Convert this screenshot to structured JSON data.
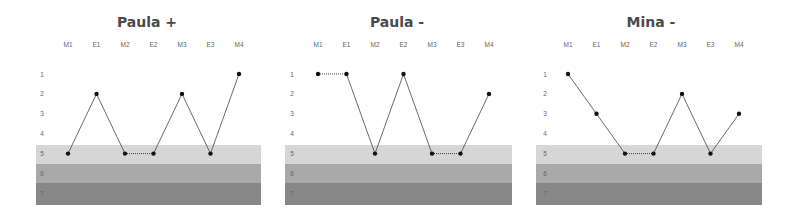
{
  "chart_data": [
    {
      "type": "line",
      "title": "Paula +",
      "categories": [
        "M1",
        "E1",
        "M2",
        "E2",
        "M3",
        "E3",
        "M4"
      ],
      "values": [
        5,
        2,
        5,
        5,
        2,
        5,
        1
      ],
      "ylabel": "",
      "xlabel": "",
      "y_ticks": [
        1,
        2,
        3,
        4,
        5,
        6,
        7
      ],
      "y_inverted": true,
      "bands": [
        {
          "value": 5,
          "color": "#d6d6d6"
        },
        {
          "value": 6,
          "color": "#a9a9a9"
        },
        {
          "value": 7,
          "color": "#888888"
        }
      ],
      "grid": false,
      "note": "equal adjacent values joined by dotted line"
    },
    {
      "type": "line",
      "title": "Paula -",
      "categories": [
        "M1",
        "E1",
        "M2",
        "E2",
        "M3",
        "E3",
        "M4"
      ],
      "values": [
        1,
        1,
        5,
        1,
        5,
        5,
        2
      ],
      "ylabel": "",
      "xlabel": "",
      "y_ticks": [
        1,
        2,
        3,
        4,
        5,
        6,
        7
      ],
      "y_inverted": true,
      "bands": [
        {
          "value": 5,
          "color": "#d6d6d6"
        },
        {
          "value": 6,
          "color": "#a9a9a9"
        },
        {
          "value": 7,
          "color": "#888888"
        }
      ],
      "grid": false
    },
    {
      "type": "line",
      "title": "Mina -",
      "categories": [
        "M1",
        "E1",
        "M2",
        "E2",
        "M3",
        "E3",
        "M4"
      ],
      "values": [
        1,
        3,
        5,
        5,
        2,
        5,
        3
      ],
      "ylabel": "",
      "xlabel": "",
      "y_ticks": [
        1,
        2,
        3,
        4,
        5,
        6,
        7
      ],
      "y_inverted": true,
      "bands": [
        {
          "value": 5,
          "color": "#d6d6d6"
        },
        {
          "value": 6,
          "color": "#a9a9a9"
        },
        {
          "value": 7,
          "color": "#888888"
        }
      ],
      "grid": false
    }
  ],
  "panels": [
    {
      "title": "Paula +"
    },
    {
      "title": "Paula -"
    },
    {
      "title": "Mina -"
    }
  ]
}
